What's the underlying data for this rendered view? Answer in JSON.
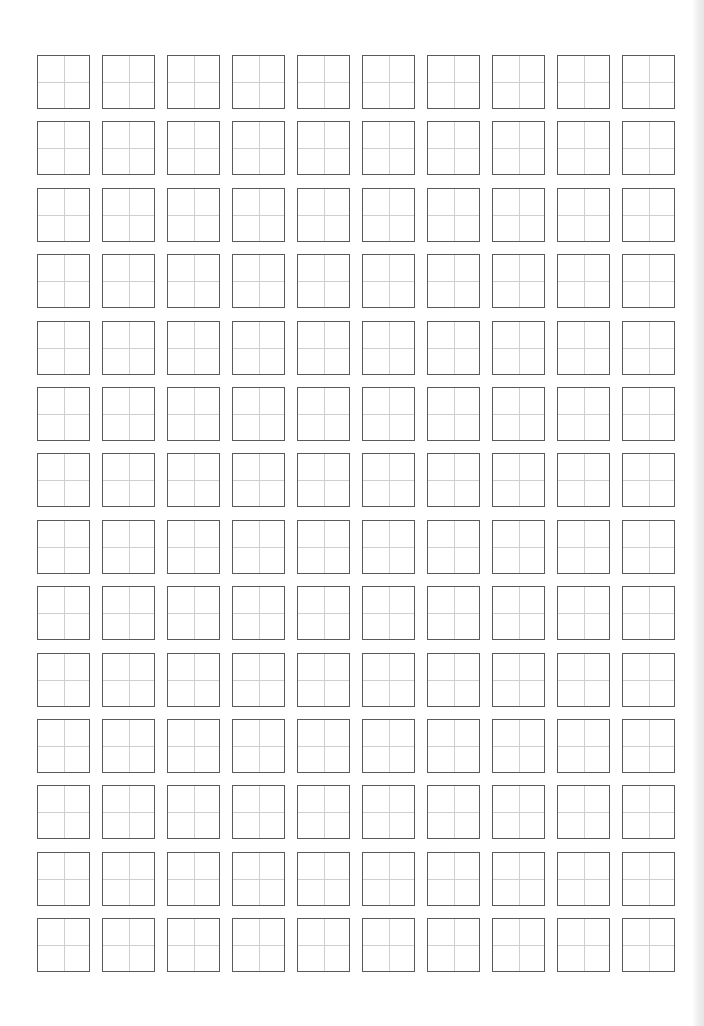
{
  "document": {
    "type": "tianzige-practice-sheet",
    "rows": 14,
    "columns": 10,
    "cells_total": 140,
    "cell_content": "",
    "colors": {
      "background": "#ffffff",
      "cell_border": "#5a5a5a",
      "guide_lines": "#cfcfcf"
    }
  }
}
